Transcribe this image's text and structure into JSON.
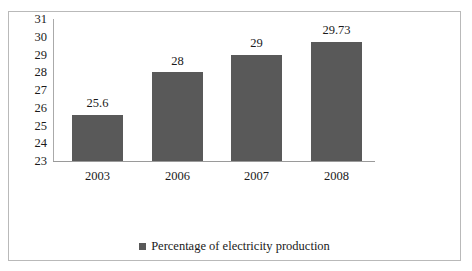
{
  "chart_data": {
    "type": "bar",
    "title": "",
    "xlabel": "",
    "ylabel": "",
    "categories": [
      "2003",
      "2006",
      "2007",
      "2008"
    ],
    "values": [
      25.6,
      28,
      29,
      29.73
    ],
    "value_labels": [
      "25.6",
      "28",
      "29",
      "29.73"
    ],
    "ylim": [
      23,
      31
    ],
    "yticks": [
      31,
      30,
      29,
      28,
      27,
      26,
      25,
      24,
      23
    ],
    "ytick_labels": [
      "31",
      "30",
      "29",
      "28",
      "27",
      "26",
      "25",
      "24",
      "23"
    ],
    "grid": false,
    "legend_position": "bottom",
    "series": [
      {
        "name": "Percentage of electricity production",
        "color": "#595959",
        "values": [
          25.6,
          28,
          29,
          29.73
        ]
      }
    ]
  },
  "legend": {
    "marker": "square-marker",
    "label": "Percentage of electricity production"
  }
}
